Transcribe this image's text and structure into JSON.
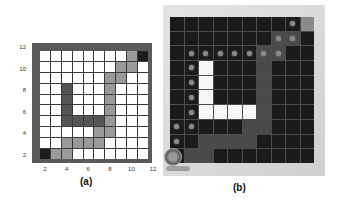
{
  "panel_a": {
    "caption": "(a)",
    "y_ticks": [
      "12",
      "10",
      "8",
      "6",
      "4",
      "2"
    ],
    "x_ticks": [
      "2",
      "4",
      "6",
      "8",
      "10",
      "12"
    ],
    "grid_size": 10,
    "legend_colors": {
      "free": "#ffffff",
      "path": "#9a9a9a",
      "obstacle": "#555555",
      "endpoint": "#1c1c1c"
    },
    "rows": [
      [
        "f",
        "f",
        "f",
        "f",
        "f",
        "f",
        "f",
        "f",
        "p",
        "e"
      ],
      [
        "f",
        "f",
        "f",
        "f",
        "f",
        "f",
        "f",
        "p",
        "p",
        "f"
      ],
      [
        "f",
        "f",
        "f",
        "f",
        "f",
        "f",
        "p",
        "p",
        "f",
        "f"
      ],
      [
        "f",
        "f",
        "o",
        "f",
        "f",
        "f",
        "p",
        "f",
        "f",
        "f"
      ],
      [
        "f",
        "f",
        "o",
        "f",
        "f",
        "f",
        "p",
        "f",
        "f",
        "f"
      ],
      [
        "f",
        "f",
        "o",
        "f",
        "f",
        "f",
        "p",
        "f",
        "f",
        "f"
      ],
      [
        "f",
        "f",
        "o",
        "o",
        "o",
        "o",
        "p",
        "f",
        "f",
        "f"
      ],
      [
        "f",
        "f",
        "f",
        "f",
        "f",
        "p",
        "p",
        "f",
        "f",
        "f"
      ],
      [
        "f",
        "f",
        "p",
        "p",
        "p",
        "p",
        "f",
        "f",
        "f",
        "f"
      ],
      [
        "e",
        "p",
        "p",
        "f",
        "f",
        "f",
        "f",
        "f",
        "f",
        "f"
      ]
    ]
  },
  "panel_b": {
    "caption": "(b)",
    "grid_size": 10,
    "legend_colors": {
      "free": "#1b1b1b",
      "path": "#4a4a4a",
      "obstacle": "#f6f6f6",
      "goal": "#8a8a8a",
      "waypoint": "#8a8a8a"
    },
    "rows": [
      [
        "f",
        "f",
        "f",
        "f",
        "f",
        "f",
        "f",
        "f",
        "f",
        "g"
      ],
      [
        "f",
        "f",
        "f",
        "f",
        "f",
        "f",
        "f",
        "p",
        "p",
        "f"
      ],
      [
        "f",
        "f",
        "f",
        "f",
        "f",
        "f",
        "p",
        "p",
        "f",
        "f"
      ],
      [
        "f",
        "f",
        "o",
        "f",
        "f",
        "f",
        "p",
        "f",
        "f",
        "f"
      ],
      [
        "f",
        "f",
        "o",
        "f",
        "f",
        "f",
        "p",
        "f",
        "f",
        "f"
      ],
      [
        "f",
        "f",
        "o",
        "f",
        "f",
        "f",
        "p",
        "f",
        "f",
        "f"
      ],
      [
        "f",
        "f",
        "o",
        "o",
        "o",
        "o",
        "p",
        "f",
        "f",
        "f"
      ],
      [
        "f",
        "f",
        "f",
        "f",
        "f",
        "p",
        "p",
        "f",
        "f",
        "f"
      ],
      [
        "f",
        "f",
        "p",
        "p",
        "p",
        "p",
        "f",
        "f",
        "f",
        "f"
      ],
      [
        "f",
        "p",
        "p",
        "f",
        "f",
        "f",
        "f",
        "f",
        "f",
        "f"
      ]
    ],
    "waypoints": [
      [
        0,
        8
      ],
      [
        1,
        7
      ],
      [
        1,
        8
      ],
      [
        2,
        1
      ],
      [
        2,
        2
      ],
      [
        2,
        3
      ],
      [
        2,
        4
      ],
      [
        2,
        5
      ],
      [
        2,
        6
      ],
      [
        2,
        7
      ],
      [
        3,
        1
      ],
      [
        4,
        1
      ],
      [
        5,
        1
      ],
      [
        6,
        1
      ],
      [
        7,
        0
      ],
      [
        7,
        1
      ],
      [
        8,
        0
      ]
    ],
    "robot_position": [
      9,
      0
    ]
  }
}
